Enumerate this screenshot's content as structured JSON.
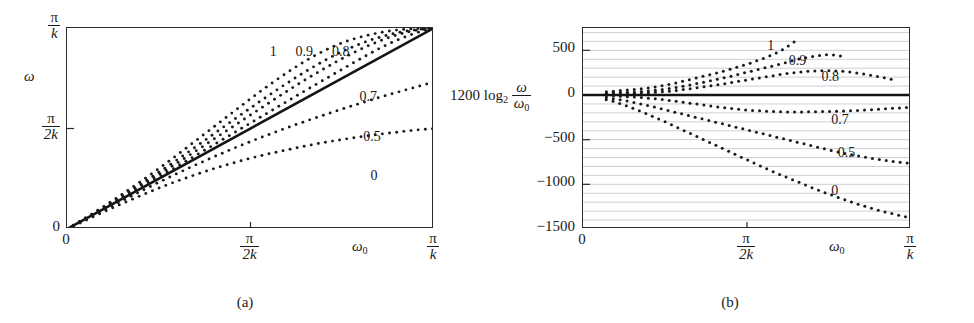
{
  "figure": {
    "panels": [
      {
        "id": "a",
        "caption": "(a)",
        "axis": {
          "y_name": "ω",
          "x_name": "ω",
          "x_name_sub": "0",
          "y_ticks": [
            {
              "value": 1.0,
              "num": "π",
              "den": "k"
            },
            {
              "value": 0.5,
              "num": "π",
              "den": "2k"
            },
            {
              "value": 0.0,
              "plain": "0"
            }
          ],
          "x_ticks": [
            {
              "value": 0.0,
              "plain": "0"
            },
            {
              "value": 0.5,
              "num": "π",
              "den": "2k"
            },
            {
              "value": 1.0,
              "num": "π",
              "den": "k"
            }
          ]
        },
        "curve_labels": [
          {
            "text": "1",
            "x": 0.555,
            "y": 0.915
          },
          {
            "text": "0.9",
            "x": 0.625,
            "y": 0.915
          },
          {
            "text": "0.8",
            "x": 0.725,
            "y": 0.915
          },
          {
            "text": "0.7",
            "x": 0.8,
            "y": 0.69
          },
          {
            "text": "0.5",
            "x": 0.81,
            "y": 0.495
          },
          {
            "text": "0",
            "x": 0.83,
            "y": 0.3
          }
        ]
      },
      {
        "id": "b",
        "caption": "(b)",
        "axis": {
          "y_name_prefix": "1200 log",
          "y_name_sub": "2",
          "y_name_num": "ω",
          "y_name_den": "ω",
          "y_name_den_sub": "0",
          "x_name": "ω",
          "x_name_sub": "0",
          "y_ticks": [
            {
              "value": 500,
              "plain": "500"
            },
            {
              "value": 0,
              "plain": "0"
            },
            {
              "value": -500,
              "plain": "−500"
            },
            {
              "value": -1000,
              "plain": "−1000"
            },
            {
              "value": -1500,
              "plain": "−1500"
            }
          ],
          "x_ticks": [
            {
              "value": 0.0,
              "plain": "0"
            },
            {
              "value": 0.5,
              "num": "π",
              "den": "2k"
            },
            {
              "value": 1.0,
              "num": "π",
              "den": "k"
            }
          ]
        },
        "curve_labels": [
          {
            "text": "1",
            "x": 0.565,
            "y": 0.945
          },
          {
            "text": "0.9",
            "x": 0.63,
            "y": 0.87
          },
          {
            "text": "0.8",
            "x": 0.73,
            "y": 0.79
          },
          {
            "text": "0.7",
            "x": 0.76,
            "y": 0.575
          },
          {
            "text": "0.5",
            "x": 0.78,
            "y": 0.415
          },
          {
            "text": "0",
            "x": 0.76,
            "y": 0.225
          }
        ]
      }
    ]
  },
  "chart_data": [
    {
      "type": "line",
      "panel": "a",
      "title": "",
      "xlabel": "ω₀",
      "ylabel": "ω",
      "xlim": [
        0,
        1
      ],
      "ylim": [
        0,
        1
      ],
      "xtick_labels": [
        "0",
        "π/2k",
        "π/k"
      ],
      "xtick_values": [
        0,
        0.5,
        1
      ],
      "ytick_labels": [
        "0",
        "π/2k",
        "π/k"
      ],
      "ytick_values": [
        0,
        0.5,
        1
      ],
      "grid": false,
      "legend": "inline-curve-labels",
      "note": "x and y normalised so 1 = pi/k. Reference solid line is the identity omega = omega_0.",
      "reference_line": {
        "name": "identity",
        "style": "solid",
        "x": [
          0,
          1
        ],
        "y": [
          0,
          1
        ]
      },
      "series": [
        {
          "name": "1",
          "style": "dotted",
          "x": [
            0,
            0.05,
            0.1,
            0.15,
            0.2,
            0.25,
            0.3,
            0.35,
            0.4,
            0.45,
            0.5,
            0.55,
            0.6,
            0.65,
            0.7,
            0.75,
            0.8,
            0.85,
            0.9,
            0.95,
            1.0
          ],
          "y": [
            0,
            0.055,
            0.112,
            0.172,
            0.235,
            0.3,
            0.368,
            0.438,
            0.508,
            0.578,
            0.648,
            0.715,
            0.778,
            0.836,
            0.886,
            0.926,
            0.955,
            0.976,
            0.99,
            0.997,
            1.0
          ]
        },
        {
          "name": "0.9",
          "style": "dotted",
          "x": [
            0,
            0.05,
            0.1,
            0.15,
            0.2,
            0.25,
            0.3,
            0.35,
            0.4,
            0.45,
            0.5,
            0.55,
            0.6,
            0.65,
            0.7,
            0.75,
            0.8,
            0.85,
            0.9,
            0.95,
            1.0
          ],
          "y": [
            0,
            0.053,
            0.108,
            0.164,
            0.222,
            0.282,
            0.344,
            0.408,
            0.473,
            0.538,
            0.602,
            0.665,
            0.726,
            0.783,
            0.836,
            0.883,
            0.922,
            0.953,
            0.976,
            0.991,
            1.0
          ]
        },
        {
          "name": "0.8",
          "style": "dotted",
          "x": [
            0,
            0.05,
            0.1,
            0.15,
            0.2,
            0.25,
            0.3,
            0.35,
            0.4,
            0.45,
            0.5,
            0.55,
            0.6,
            0.65,
            0.7,
            0.75,
            0.8,
            0.85,
            0.9,
            0.95,
            1.0
          ],
          "y": [
            0,
            0.052,
            0.105,
            0.159,
            0.214,
            0.27,
            0.328,
            0.387,
            0.447,
            0.507,
            0.567,
            0.627,
            0.686,
            0.743,
            0.797,
            0.848,
            0.894,
            0.934,
            0.966,
            0.988,
            1.0
          ]
        },
        {
          "name": "0.7",
          "style": "dotted",
          "x": [
            0,
            0.05,
            0.1,
            0.15,
            0.2,
            0.25,
            0.3,
            0.35,
            0.4,
            0.45,
            0.5,
            0.55,
            0.6,
            0.65,
            0.7,
            0.75,
            0.8,
            0.85,
            0.9,
            0.95,
            1.0
          ],
          "y": [
            0,
            0.05,
            0.101,
            0.153,
            0.205,
            0.258,
            0.311,
            0.365,
            0.419,
            0.473,
            0.527,
            0.581,
            0.635,
            0.689,
            0.742,
            0.795,
            0.847,
            0.897,
            0.94,
            0.975,
            1.0
          ]
        },
        {
          "name": "0.5",
          "style": "dotted",
          "x": [
            0,
            0.05,
            0.1,
            0.15,
            0.2,
            0.25,
            0.3,
            0.35,
            0.4,
            0.45,
            0.5,
            0.55,
            0.6,
            0.65,
            0.7,
            0.75,
            0.8,
            0.85,
            0.9,
            0.95,
            1.0
          ],
          "y": [
            0,
            0.046,
            0.093,
            0.14,
            0.186,
            0.232,
            0.276,
            0.318,
            0.359,
            0.398,
            0.435,
            0.47,
            0.504,
            0.536,
            0.567,
            0.597,
            0.626,
            0.654,
            0.68,
            0.706,
            0.731
          ]
        },
        {
          "name": "0",
          "style": "dotted",
          "x": [
            0,
            0.05,
            0.1,
            0.15,
            0.2,
            0.25,
            0.3,
            0.35,
            0.4,
            0.45,
            0.5,
            0.55,
            0.6,
            0.65,
            0.7,
            0.75,
            0.8,
            0.85,
            0.9,
            0.95,
            1.0
          ],
          "y": [
            0,
            0.042,
            0.085,
            0.126,
            0.165,
            0.203,
            0.238,
            0.27,
            0.3,
            0.327,
            0.352,
            0.374,
            0.394,
            0.413,
            0.43,
            0.445,
            0.459,
            0.471,
            0.482,
            0.492,
            0.5
          ]
        }
      ]
    },
    {
      "type": "line",
      "panel": "b",
      "title": "",
      "xlabel": "ω₀",
      "ylabel": "1200 log₂ (ω/ω₀)",
      "xlim": [
        0,
        1
      ],
      "ylim": [
        -1500,
        750
      ],
      "xtick_labels": [
        "0",
        "π/2k",
        "π/k"
      ],
      "xtick_values": [
        0,
        0.5,
        1
      ],
      "ytick_labels": [
        "500",
        "0",
        "−500",
        "−1000",
        "−1500"
      ],
      "ytick_values": [
        500,
        0,
        -500,
        -1000,
        -1500
      ],
      "grid": true,
      "grid_spacing": 100,
      "legend": "inline-curve-labels",
      "note": "Deviation in cents from the identity mapping; the heavy horizontal line is 0 cents.",
      "reference_line": {
        "name": "zero-cents",
        "style": "solid",
        "x": [
          0,
          1
        ],
        "y": [
          0,
          0
        ]
      },
      "series": [
        {
          "name": "1",
          "style": "dotted",
          "x": [
            0.05,
            0.1,
            0.15,
            0.2,
            0.25,
            0.3,
            0.35,
            0.4,
            0.45,
            0.5,
            0.55,
            0.6,
            0.65
          ],
          "y": [
            30,
            45,
            60,
            80,
            110,
            150,
            195,
            240,
            290,
            345,
            410,
            490,
            610
          ]
        },
        {
          "name": "0.9",
          "style": "dotted",
          "x": [
            0.05,
            0.1,
            0.15,
            0.2,
            0.25,
            0.3,
            0.35,
            0.4,
            0.45,
            0.5,
            0.55,
            0.6,
            0.65,
            0.7,
            0.75,
            0.8
          ],
          "y": [
            18,
            25,
            32,
            45,
            65,
            95,
            130,
            170,
            210,
            255,
            300,
            345,
            395,
            430,
            450,
            430
          ]
        },
        {
          "name": "0.8",
          "style": "dotted",
          "x": [
            0.05,
            0.1,
            0.15,
            0.2,
            0.25,
            0.3,
            0.35,
            0.4,
            0.45,
            0.5,
            0.55,
            0.6,
            0.65,
            0.7,
            0.75,
            0.8,
            0.85,
            0.9,
            0.95
          ],
          "y": [
            10,
            14,
            18,
            25,
            38,
            58,
            82,
            108,
            138,
            168,
            198,
            228,
            252,
            268,
            272,
            262,
            238,
            205,
            170
          ]
        },
        {
          "name": "0.7",
          "style": "dotted",
          "x": [
            0.05,
            0.1,
            0.15,
            0.2,
            0.25,
            0.3,
            0.35,
            0.4,
            0.45,
            0.5,
            0.55,
            0.6,
            0.65,
            0.7,
            0.75,
            0.8,
            0.85,
            0.9,
            0.95,
            1.0
          ],
          "y": [
            -5,
            -12,
            -22,
            -36,
            -55,
            -78,
            -103,
            -128,
            -150,
            -168,
            -180,
            -188,
            -190,
            -188,
            -184,
            -178,
            -170,
            -160,
            -148,
            -135
          ]
        },
        {
          "name": "0.5",
          "style": "dotted",
          "x": [
            0.05,
            0.1,
            0.15,
            0.2,
            0.25,
            0.3,
            0.35,
            0.4,
            0.45,
            0.5,
            0.55,
            0.6,
            0.65,
            0.7,
            0.75,
            0.8,
            0.85,
            0.9,
            0.95,
            1.0
          ],
          "y": [
            -20,
            -45,
            -80,
            -120,
            -165,
            -210,
            -255,
            -300,
            -345,
            -390,
            -435,
            -480,
            -525,
            -570,
            -615,
            -655,
            -690,
            -720,
            -745,
            -765
          ]
        },
        {
          "name": "0",
          "style": "dotted",
          "x": [
            0.05,
            0.1,
            0.15,
            0.2,
            0.25,
            0.3,
            0.35,
            0.4,
            0.45,
            0.5,
            0.55,
            0.6,
            0.65,
            0.7,
            0.75,
            0.8,
            0.85,
            0.9,
            0.95,
            1.0
          ],
          "y": [
            -35,
            -80,
            -145,
            -220,
            -300,
            -385,
            -470,
            -555,
            -640,
            -725,
            -810,
            -890,
            -965,
            -1040,
            -1110,
            -1175,
            -1235,
            -1290,
            -1335,
            -1375
          ]
        }
      ]
    }
  ]
}
